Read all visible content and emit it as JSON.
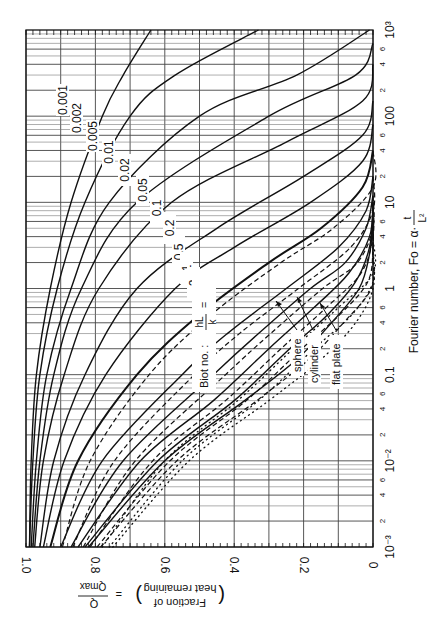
{
  "chart_data": {
    "type": "line",
    "title": "",
    "orientation": "rotated-90-clockwise",
    "xlabel": "Fourier number, Fo = α·t/L²",
    "ylabel": "(Fraction of heat remaining) = Q/Qmax",
    "xscale": "log",
    "xlim": [
      0.001,
      1000
    ],
    "ylim": [
      0,
      1.0
    ],
    "x_ticks": [
      {
        "value": 0.001,
        "label": "10⁻³"
      },
      {
        "value": 0.002,
        "label": "2"
      },
      {
        "value": 0.004,
        "label": "4"
      },
      {
        "value": 0.006,
        "label": "6"
      },
      {
        "value": 0.01,
        "label": "10⁻²"
      },
      {
        "value": 0.02,
        "label": "2"
      },
      {
        "value": 0.04,
        "label": "4"
      },
      {
        "value": 0.06,
        "label": "6"
      },
      {
        "value": 0.1,
        "label": "0.1"
      },
      {
        "value": 0.2,
        "label": "2"
      },
      {
        "value": 0.4,
        "label": "4"
      },
      {
        "value": 0.6,
        "label": "6"
      },
      {
        "value": 1,
        "label": "1"
      },
      {
        "value": 2,
        "label": "2"
      },
      {
        "value": 4,
        "label": "4"
      },
      {
        "value": 6,
        "label": "6"
      },
      {
        "value": 10,
        "label": "10"
      },
      {
        "value": 20,
        "label": "2"
      },
      {
        "value": 40,
        "label": "4"
      },
      {
        "value": 60,
        "label": "6"
      },
      {
        "value": 100,
        "label": "100"
      },
      {
        "value": 200,
        "label": "2"
      },
      {
        "value": 400,
        "label": "4"
      },
      {
        "value": 600,
        "label": "6"
      },
      {
        "value": 1000,
        "label": "10³"
      }
    ],
    "y_ticks": [
      {
        "value": 1.0,
        "label": "1.0"
      },
      {
        "value": 0.8,
        "label": "0.8"
      },
      {
        "value": 0.6,
        "label": "0.6"
      },
      {
        "value": 0.4,
        "label": "0.4"
      },
      {
        "value": 0.2,
        "label": "0.2"
      },
      {
        "value": 0,
        "label": "0"
      }
    ],
    "grid": true,
    "legend": {
      "title": "Biot no.: hL/k =",
      "line_styles": [
        {
          "name": "sphere",
          "style": "solid"
        },
        {
          "name": "cylinder",
          "style": "dashed"
        },
        {
          "name": "flat plate",
          "style": "dotted"
        }
      ]
    },
    "series": [
      {
        "name": "0.001",
        "biot": 0.001,
        "style": "solid",
        "x": [
          0.001,
          0.01,
          0.1,
          1,
          10,
          100,
          300,
          1000
        ],
        "y": [
          0.99,
          0.985,
          0.97,
          0.93,
          0.87,
          0.78,
          0.72,
          0.64
        ]
      },
      {
        "name": "0.002",
        "biot": 0.002,
        "style": "solid",
        "x": [
          0.001,
          0.01,
          0.1,
          1,
          10,
          100,
          300,
          1000
        ],
        "y": [
          0.99,
          0.98,
          0.96,
          0.91,
          0.83,
          0.7,
          0.57,
          0.33
        ]
      },
      {
        "name": "0.005",
        "biot": 0.005,
        "style": "solid",
        "x": [
          0.001,
          0.01,
          0.1,
          1,
          10,
          100,
          300,
          1000
        ],
        "y": [
          0.985,
          0.97,
          0.94,
          0.87,
          0.76,
          0.5,
          0.22,
          0.01
        ]
      },
      {
        "name": "0.01",
        "biot": 0.01,
        "style": "solid",
        "x": [
          0.001,
          0.01,
          0.1,
          1,
          10,
          100,
          300,
          700
        ],
        "y": [
          0.98,
          0.96,
          0.92,
          0.84,
          0.68,
          0.3,
          0.05,
          0.0
        ]
      },
      {
        "name": "0.02",
        "biot": 0.02,
        "style": "solid",
        "x": [
          0.001,
          0.01,
          0.1,
          1,
          10,
          50,
          150,
          400
        ],
        "y": [
          0.975,
          0.95,
          0.89,
          0.79,
          0.58,
          0.25,
          0.03,
          0.0
        ]
      },
      {
        "name": "0.05",
        "biot": 0.05,
        "style": "solid",
        "x": [
          0.001,
          0.01,
          0.1,
          1,
          5,
          20,
          60,
          150
        ],
        "y": [
          0.96,
          0.92,
          0.83,
          0.68,
          0.45,
          0.2,
          0.03,
          0.0
        ]
      },
      {
        "name": "0.1",
        "biot": 0.1,
        "style": "solid",
        "x": [
          0.001,
          0.01,
          0.1,
          1,
          3,
          10,
          30,
          80
        ],
        "y": [
          0.95,
          0.89,
          0.77,
          0.57,
          0.4,
          0.18,
          0.03,
          0.0
        ]
      },
      {
        "name": "0.2",
        "biot": 0.2,
        "style": "heavy",
        "x": [
          0.001,
          0.01,
          0.1,
          0.5,
          2,
          5,
          15,
          40
        ],
        "y": [
          0.93,
          0.85,
          0.68,
          0.5,
          0.3,
          0.15,
          0.03,
          0.0
        ]
      },
      {
        "name": "0.5",
        "biot": 0.5,
        "style": "solid",
        "x": [
          0.001,
          0.01,
          0.1,
          0.3,
          1,
          3,
          8,
          20
        ],
        "y": [
          0.9,
          0.78,
          0.55,
          0.42,
          0.25,
          0.1,
          0.02,
          0.0
        ]
      },
      {
        "name": "1",
        "biot": 1,
        "style": "solid",
        "x": [
          0.001,
          0.01,
          0.1,
          0.3,
          1,
          2,
          5,
          12
        ],
        "y": [
          0.87,
          0.72,
          0.46,
          0.33,
          0.18,
          0.08,
          0.02,
          0.0
        ]
      },
      {
        "name": "2",
        "biot": 2,
        "style": "solid",
        "x": [
          0.001,
          0.01,
          0.05,
          0.2,
          0.6,
          1.5,
          4,
          10
        ],
        "y": [
          0.85,
          0.67,
          0.46,
          0.3,
          0.17,
          0.07,
          0.01,
          0.0
        ]
      },
      {
        "name": "5",
        "biot": 5,
        "style": "solid",
        "x": [
          0.001,
          0.01,
          0.05,
          0.2,
          0.5,
          1.2,
          3,
          8
        ],
        "y": [
          0.83,
          0.62,
          0.4,
          0.24,
          0.13,
          0.05,
          0.01,
          0.0
        ]
      },
      {
        "name": "∞",
        "biot": "infinity",
        "style": "solid",
        "x": [
          0.001,
          0.01,
          0.05,
          0.15,
          0.4,
          1,
          2.5,
          6
        ],
        "y": [
          0.82,
          0.6,
          0.37,
          0.22,
          0.12,
          0.04,
          0.01,
          0.0
        ]
      }
    ],
    "annotations": [
      "0.001",
      "0.002",
      "0.005",
      "0.01",
      "0.02",
      "0.05",
      "0.1",
      "0.2",
      "0.5",
      "1",
      "2",
      "5",
      "∞",
      "Biot no. : hL/k =",
      "sphere",
      "cylinder",
      "flat plate"
    ]
  },
  "axes": {
    "fo_axis_title": "Fourier number,  Fo = α·",
    "fo_frac_num": "t",
    "fo_frac_den": "L²",
    "q_axis_title_line1": "Fraction of",
    "q_axis_title_line2": "heat remaining",
    "q_frac_num": "Q",
    "q_frac_den": "Qmax",
    "biot_title": "Biot no. :",
    "biot_num": "hL",
    "biot_den": "k",
    "biot_eq": "="
  },
  "legend_labels": {
    "sphere": "sphere",
    "cylinder": "cylinder",
    "flat_plate": "flat plate"
  }
}
